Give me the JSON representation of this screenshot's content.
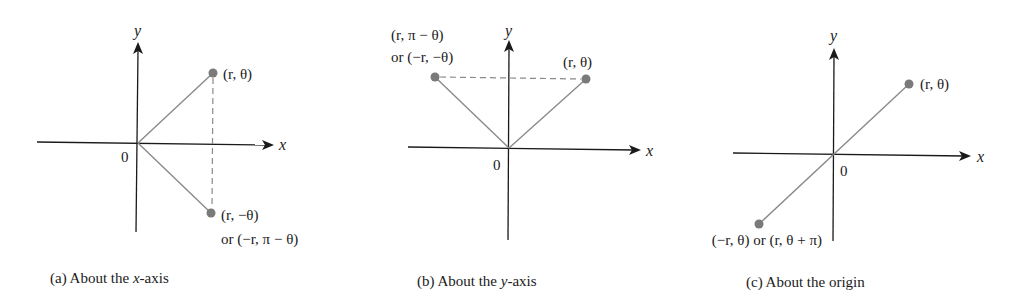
{
  "figure": {
    "panels": [
      {
        "id": "a",
        "caption_prefix": "(a)  About the ",
        "caption_var": "x",
        "caption_suffix": "-axis",
        "origin_label": "0",
        "x_label": "x",
        "y_label": "y",
        "points": [
          {
            "label_line1": "(r, θ)",
            "label_line2": ""
          },
          {
            "label_line1": "(r, −θ)",
            "label_line2": "or (−r, π − θ)"
          }
        ],
        "symmetry": "reflection about x-axis"
      },
      {
        "id": "b",
        "caption_prefix": "(b)  About the ",
        "caption_var": "y",
        "caption_suffix": "-axis",
        "origin_label": "0",
        "x_label": "x",
        "y_label": "y",
        "points": [
          {
            "label_line1": "(r, θ)",
            "label_line2": ""
          },
          {
            "label_line1": "(r, π − θ)",
            "label_line2": "or (−r, −θ)"
          }
        ],
        "symmetry": "reflection about y-axis"
      },
      {
        "id": "c",
        "caption_prefix": "(c)  About the origin",
        "caption_var": "",
        "caption_suffix": "",
        "origin_label": "0",
        "x_label": "x",
        "y_label": "y",
        "points": [
          {
            "label_line1": "(r, θ)",
            "label_line2": ""
          },
          {
            "label_line1": "(−r, θ) or (r, θ + π)",
            "label_line2": ""
          }
        ],
        "symmetry": "reflection about origin"
      }
    ],
    "colors": {
      "axis": "#1a1a1a",
      "ray": "#8a8a8a",
      "point": "#7a7a7a",
      "background": "#ffffff"
    }
  }
}
